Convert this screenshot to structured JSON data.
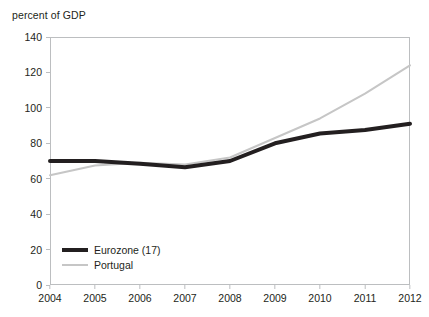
{
  "chart_data": {
    "type": "line",
    "title": "",
    "xlabel": "",
    "ylabel": "percent of GDP",
    "categories": [
      "2004",
      "2005",
      "2006",
      "2007",
      "2008",
      "2009",
      "2010",
      "2011",
      "2012"
    ],
    "x": [
      2004,
      2005,
      2006,
      2007,
      2008,
      2009,
      2010,
      2011,
      2012
    ],
    "ylim": [
      0,
      140
    ],
    "ytick_labels": [
      "0",
      "20",
      "40",
      "60",
      "80",
      "100",
      "120",
      "140"
    ],
    "yticks": [
      0,
      20,
      40,
      60,
      80,
      100,
      120,
      140
    ],
    "grid": false,
    "legend_position": "lower-left-inside",
    "series": [
      {
        "name": "Eurozone (17)",
        "color": "#231f20",
        "width": 4,
        "values": [
          70,
          70,
          68.5,
          66.5,
          70,
          80,
          85.5,
          87.5,
          91
        ]
      },
      {
        "name": "Portugal",
        "color": "#c6c6c6",
        "width": 2,
        "values": [
          62,
          67.5,
          69,
          68,
          72,
          83,
          94,
          108,
          124
        ]
      }
    ]
  },
  "legend": {
    "items": [
      {
        "label": "Eurozone (17)"
      },
      {
        "label": "Portugal"
      }
    ]
  },
  "colors": {
    "eurozone": "#231f20",
    "portugal": "#c6c6c6",
    "frame": "#bcbec0",
    "text": "#231f20",
    "background": "#ffffff"
  }
}
